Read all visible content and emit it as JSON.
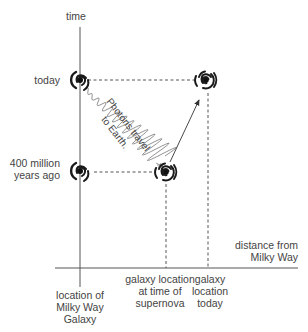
{
  "diagram": {
    "axes": {
      "y_label": "time",
      "x_label_line1": "distance from",
      "x_label_line2": "Milky Way"
    },
    "time_markers": {
      "today": "today",
      "past_line1": "400 million",
      "past_line2": "years ago"
    },
    "x_markers": {
      "milky_way_line1": "location of",
      "milky_way_line2": "Milky Way",
      "milky_way_line3": "Galaxy",
      "supernova_line1": "galaxy location",
      "supernova_line2": "at time of",
      "supernova_line3": "supernova",
      "today_line1": "galaxy",
      "today_line2": "location",
      "today_line3": "today"
    },
    "photon_label_line1": "Photons travel",
    "photon_label_line2": "to Earth.",
    "icons": [
      "milky-way-spiral-today",
      "milky-way-spiral-past",
      "distant-galaxy-spiral-past",
      "distant-galaxy-spiral-today"
    ],
    "colors": {
      "line": "#555555",
      "spiral": "#1a1a1a",
      "text": "#444444"
    }
  }
}
